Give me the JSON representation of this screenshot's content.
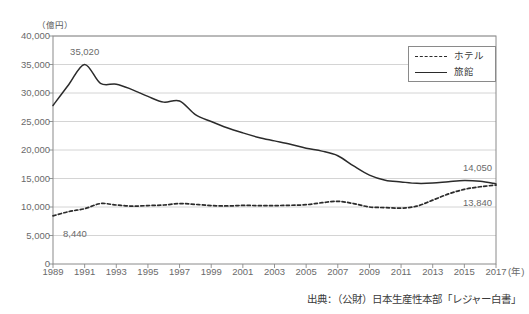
{
  "chart_data": {
    "type": "line",
    "title": "",
    "xlabel": "年",
    "ylabel": "億円",
    "unit_label": "（億円）",
    "x": [
      1989,
      1990,
      1991,
      1992,
      1993,
      1994,
      1995,
      1996,
      1997,
      1998,
      1999,
      2000,
      2001,
      2002,
      2003,
      2004,
      2005,
      2006,
      2007,
      2008,
      2009,
      2010,
      2011,
      2012,
      2013,
      2014,
      2015,
      2016,
      2017
    ],
    "xlim": [
      1989,
      2017
    ],
    "ylim": [
      0,
      40000
    ],
    "ytick_values": [
      0,
      5000,
      10000,
      15000,
      20000,
      25000,
      30000,
      35000,
      40000
    ],
    "ytick_labels": [
      "0",
      "5,000",
      "10,000",
      "15,000",
      "20,000",
      "25,000",
      "30,000",
      "35,000",
      "40,000"
    ],
    "xtick_values": [
      1989,
      1991,
      1993,
      1995,
      1997,
      1999,
      2001,
      2003,
      2005,
      2007,
      2009,
      2011,
      2013,
      2015,
      2017
    ],
    "xtick_labels": [
      "1989",
      "1991",
      "1993",
      "1995",
      "1997",
      "1999",
      "2001",
      "2003",
      "2005",
      "2007",
      "2009",
      "2011",
      "2013",
      "2015",
      "2017"
    ],
    "xtick_unit_suffix": "(年)",
    "grid": true,
    "grid_axis": "y",
    "legend_position": "top-right",
    "series": [
      {
        "name": "ホテル",
        "style": "dashed",
        "color": "#2b2b2b",
        "values": [
          8440,
          9200,
          9700,
          10600,
          10350,
          10150,
          10250,
          10350,
          10600,
          10450,
          10250,
          10180,
          10280,
          10250,
          10250,
          10300,
          10400,
          10750,
          11000,
          10600,
          10000,
          9900,
          9800,
          10150,
          11200,
          12300,
          13100,
          13550,
          13840
        ]
      },
      {
        "name": "旅館",
        "style": "solid",
        "color": "#2b2b2b",
        "values": [
          27800,
          31500,
          35020,
          31700,
          31550,
          30600,
          29400,
          28400,
          28600,
          26200,
          25000,
          23900,
          23000,
          22200,
          21600,
          21000,
          20300,
          19800,
          19000,
          17200,
          15600,
          14700,
          14400,
          14150,
          14200,
          14450,
          14650,
          14500,
          14050
        ]
      }
    ],
    "annotations": [
      {
        "name": "ryokan-peak-label",
        "text": "35,020",
        "x": 1991,
        "y": 35020,
        "dx": 0,
        "dy": -12,
        "align": "center"
      },
      {
        "name": "hotel-start-label",
        "text": "8,440",
        "x": 1989,
        "y": 8440,
        "dx": 10,
        "dy": 18,
        "align": "left"
      },
      {
        "name": "ryokan-end-label",
        "text": "14,050",
        "x": 2017,
        "y": 14050,
        "dx": -4,
        "dy": -16,
        "align": "right"
      },
      {
        "name": "hotel-end-label",
        "text": "13,840",
        "x": 2017,
        "y": 13840,
        "dx": -4,
        "dy": 18,
        "align": "right"
      }
    ],
    "colors": {
      "axis": "#8a8a8a",
      "grid": "#c9c9c9",
      "line": "#2b2b2b",
      "text": "#6a6a6a",
      "background": "#ffffff"
    }
  },
  "source": {
    "text": "出典：（公財）日本生産性本部「レジャー白書」"
  },
  "legend": {
    "items": [
      {
        "label": "ホテル",
        "style": "dashed"
      },
      {
        "label": "旅館",
        "style": "solid"
      }
    ]
  }
}
